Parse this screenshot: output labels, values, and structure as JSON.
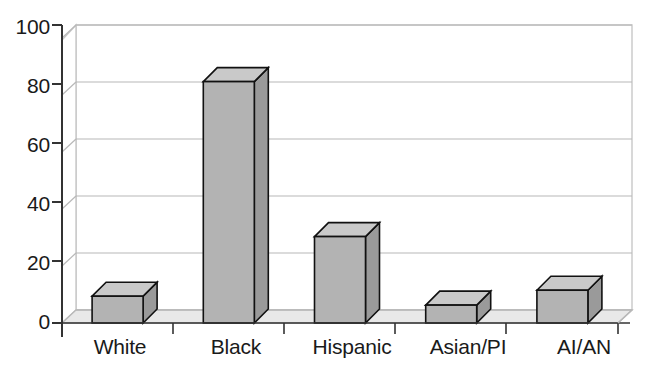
{
  "chart_data": {
    "type": "bar",
    "title": "",
    "subtitle": "",
    "xlabel": "",
    "ylabel": "",
    "categories": [
      "White",
      "Black",
      "Hispanic",
      "Asian/PI",
      "AI/AN"
    ],
    "values": [
      9,
      81,
      29,
      6,
      11
    ],
    "ylim": [
      0,
      100
    ],
    "yticks": [
      0,
      20,
      40,
      60,
      80,
      100
    ],
    "grid": true,
    "legend": false,
    "legend_position": "none",
    "style": "3d-bar",
    "annotations": []
  },
  "axes": {
    "y_tick_labels": [
      "100",
      "80",
      "60",
      "40",
      "20",
      "0"
    ],
    "x_tick_labels": [
      "White",
      "Black",
      "Hispanic",
      "Asian/PI",
      "AI/AN"
    ]
  },
  "colors": {
    "bar_front": "#b3b3b3",
    "bar_top": "#c9c9c9",
    "bar_side": "#9a9a9a",
    "bar_outline": "#111111",
    "floor": "#e8e8e8",
    "floor_edge": "#b8b8b8",
    "wall": "#ffffff",
    "wall_edge": "#c8c8c8",
    "gridline": "#b0b0b0",
    "axis": "#333333",
    "text": "#1a1a1a",
    "background": "#ffffff"
  }
}
